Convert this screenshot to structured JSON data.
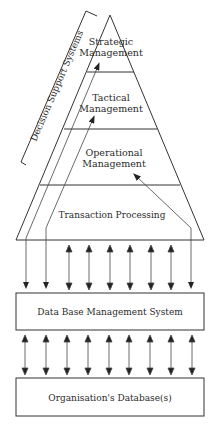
{
  "diagram": {
    "pyramid": {
      "levels": [
        {
          "line1": "Strategic",
          "line2": "Management"
        },
        {
          "line1": "Tactical",
          "line2": "Management"
        },
        {
          "line1": "Operational",
          "line2": "Management"
        },
        {
          "line1": "Transaction Processing"
        }
      ]
    },
    "bracket_label": "Decision Support Systems",
    "boxes": {
      "dbms": "Data Base Management System",
      "database": "Organisation's Database(s)"
    },
    "colors": {
      "line": "#333333",
      "text": "#2a2a2a",
      "background": "#ffffff"
    }
  }
}
